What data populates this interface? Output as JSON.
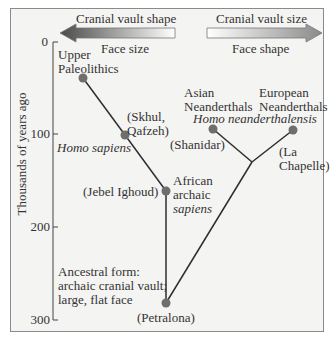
{
  "header": {
    "left_arrow": {
      "label_top": "Cranial vault shape",
      "label_bottom": "Face size",
      "direction": "left"
    },
    "right_arrow": {
      "label_top": "Cranial vault size",
      "label_bottom": "Face shape",
      "direction": "right"
    }
  },
  "axis": {
    "label": "Thousands of years ago",
    "ticks": [
      "0",
      "100",
      "200",
      "300"
    ]
  },
  "nodes": {
    "upper_paleolithics": {
      "line1": "Upper",
      "line2": "Paleolithics"
    },
    "skhul": {
      "line1": "(Skhul,",
      "line2": "Qafzeh)"
    },
    "homo_sapiens": "Homo sapiens",
    "jebel": "(Jebel Ighoud)",
    "african": {
      "line1": "African",
      "line2": "archaic",
      "line3": "sapiens"
    },
    "asian": {
      "line1": "Asian",
      "line2": "Neanderthals"
    },
    "european": {
      "line1": "European",
      "line2": "Neanderthals"
    },
    "homo_neanderthalensis": "Homo neanderthalensis",
    "shanidar": "(Shanidar)",
    "la_chapelle": {
      "line1": "(La",
      "line2": "Chapelle)"
    },
    "ancestral": {
      "line1": "Ancestral form:",
      "line2": "archaic cranial vault;",
      "line3": "large, flat face"
    },
    "petralona": "(Petralona)"
  },
  "colors": {
    "node": "#6e6e6e",
    "line": "#2e2e2e",
    "arrow_dark": "#555555",
    "background": "#f4f4f2"
  }
}
